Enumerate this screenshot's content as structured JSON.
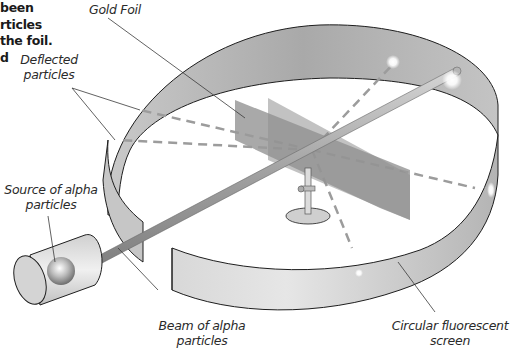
{
  "caption": {
    "lines": [
      "been",
      "rticles",
      "the foil.",
      "d"
    ]
  },
  "labels": {
    "gold_foil": "Gold Foil",
    "deflected_particles_line1": "Deflected",
    "deflected_particles_line2": "particles",
    "source_line1": "Source of alpha",
    "source_line2": "particles",
    "beam_line1": "Beam of alpha",
    "beam_line2": "particles",
    "screen_line1": "Circular fluorescent",
    "screen_line2": "screen"
  },
  "colors": {
    "screen_band": "#b8b8b8",
    "foil": "#9a9a9a",
    "dash": "#9c9c9c",
    "outline": "#1e1e1e",
    "beam": "#a8a8a8"
  }
}
